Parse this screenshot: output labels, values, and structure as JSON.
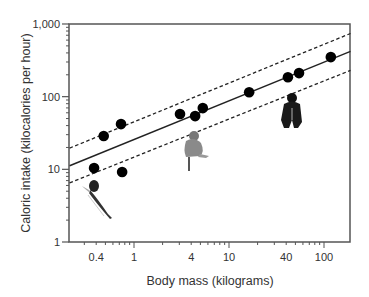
{
  "chart_data": {
    "type": "scatter",
    "title": "",
    "xlabel": "Body mass (kilograms)",
    "ylabel": "Caloric intake (kilocalories per hour)",
    "xscale": "log",
    "yscale": "log",
    "xlim": [
      0.21,
      190
    ],
    "ylim": [
      1,
      1000
    ],
    "grid": false,
    "legend": null,
    "x_ticks": [
      0.4,
      1,
      4,
      10,
      40,
      100
    ],
    "x_tick_labels": [
      "0.4",
      "1",
      "4",
      "10",
      "40",
      "100"
    ],
    "y_ticks": [
      1,
      10,
      100,
      1000
    ],
    "y_tick_labels": [
      "1",
      "10",
      "100",
      "1,000"
    ],
    "series": [
      {
        "name": "Primate species",
        "marker": "filled-circle",
        "x": [
          0.38,
          0.48,
          0.73,
          0.75,
          3.05,
          4.4,
          5.3,
          16.3,
          41.7,
          54.6,
          118
        ],
        "y": [
          10.4,
          28.7,
          41.9,
          9.2,
          57.6,
          54,
          69.6,
          115,
          185,
          211,
          350
        ]
      }
    ],
    "lines": [
      {
        "name": "Regression fit",
        "style": "solid",
        "x": [
          0.21,
          190
        ],
        "y": [
          11.2,
          420
        ]
      },
      {
        "name": "Upper confidence bound",
        "style": "dashed",
        "x": [
          0.21,
          190
        ],
        "y": [
          19.6,
          740
        ]
      },
      {
        "name": "Lower confidence bound",
        "style": "dashed",
        "x": [
          0.21,
          190
        ],
        "y": [
          6.5,
          230
        ]
      }
    ],
    "annotations": [
      {
        "type": "image",
        "name": "small-primate-illustration",
        "near_x": 0.5,
        "near_y": 4
      },
      {
        "type": "image",
        "name": "macaque-illustration",
        "near_x": 4.5,
        "near_y": 15
      },
      {
        "type": "image",
        "name": "chimpanzee-illustration",
        "near_x": 45,
        "near_y": 70
      }
    ]
  },
  "colors": {
    "frame": "#555555",
    "points": "#000000",
    "lines": "#222222",
    "text": "#333333"
  }
}
